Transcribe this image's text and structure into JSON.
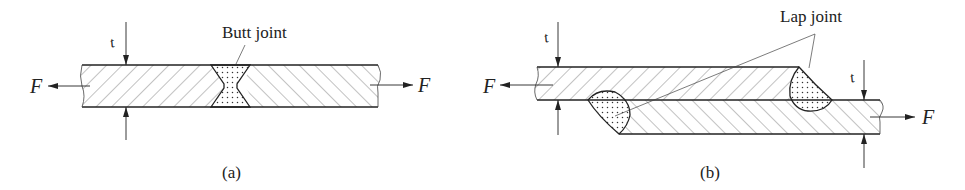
{
  "figure": {
    "panels": [
      {
        "id": "a",
        "caption": "(a)",
        "callout": "Butt joint",
        "force_left": "F",
        "force_right": "F",
        "thickness": "t"
      },
      {
        "id": "b",
        "caption": "(b)",
        "callout": "Lap joint",
        "force_left": "F",
        "force_right": "F",
        "thickness_left": "t",
        "thickness_right": "t"
      }
    ],
    "colors": {
      "line": "#222222",
      "hatch": "#555555",
      "weld_dots": "#333333",
      "background": "#ffffff"
    }
  }
}
